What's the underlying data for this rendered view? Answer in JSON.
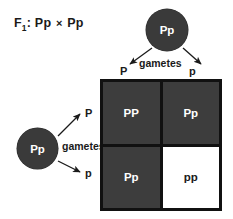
{
  "diagram": {
    "cross_label": {
      "generation": "F",
      "generation_subscript": "1",
      "separator": ":",
      "parent1_genotype": "Pp",
      "cross_symbol": "×",
      "parent2_genotype": "Pp"
    },
    "parents": {
      "top": {
        "genotype": "Pp",
        "gametes_label": "gametes",
        "gametes": [
          {
            "allele": "P",
            "position": "left"
          },
          {
            "allele": "p",
            "position": "right"
          }
        ]
      },
      "left": {
        "genotype": "Pp",
        "gametes_label": "gametes",
        "gametes": [
          {
            "allele": "P",
            "position": "top"
          },
          {
            "allele": "p",
            "position": "bottom"
          }
        ]
      }
    },
    "punnett_square": {
      "rows": 2,
      "columns": 2,
      "cells": [
        {
          "genotype": "PP",
          "shade": "dark"
        },
        {
          "genotype": "Pp",
          "shade": "dark"
        },
        {
          "genotype": "Pp",
          "shade": "dark"
        },
        {
          "genotype": "pp",
          "shade": "light"
        }
      ]
    },
    "colors": {
      "dark_fill": "#3d3d3d",
      "light_fill": "#ffffff",
      "grid_line": "#111111",
      "circle_fill": "#3a3a3a",
      "text_dark": "#1a1a1a",
      "text_light": "#ffffff"
    }
  }
}
